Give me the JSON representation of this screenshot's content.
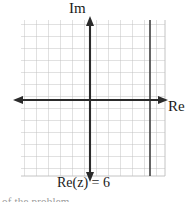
{
  "figure": {
    "name": "complex-plane-diagram",
    "background_color": "#ffffff",
    "grid": {
      "color": "#b9b9b9",
      "spacing_px": 12,
      "left_px": 21,
      "top_px": 20,
      "right_px": 165,
      "bottom_px": 176,
      "columns": 12,
      "rows": 13,
      "visible": true
    },
    "axes": {
      "color": "#2b2b2b",
      "origin": {
        "x_px": 90,
        "y_px": 100
      },
      "imaginary": {
        "label": "Im",
        "orientation": "vertical",
        "arrow_top": true,
        "arrow_bottom": true,
        "x_px": 90,
        "from_y_px": 17,
        "to_y_px": 180
      },
      "real": {
        "label": "Re",
        "orientation": "horizontal",
        "arrow_left": true,
        "arrow_right": true,
        "y_px": 100,
        "from_x_px": 14,
        "to_x_px": 167
      }
    },
    "locus": {
      "label": "Re(z) = 6",
      "equation": "Re(z) = 6",
      "type": "vertical-line",
      "real_value": 6,
      "color": "#4a4a4a",
      "x_px": 150,
      "from_y_px": 20,
      "to_y_px": 176
    }
  },
  "caption": {
    "partial_text": "of the problem."
  }
}
